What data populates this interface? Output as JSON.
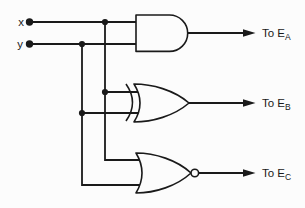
{
  "colors": {
    "ink": "#1a1a1a",
    "paper": "#fcfcfc"
  },
  "inputs": [
    {
      "label": "x"
    },
    {
      "label": "y"
    }
  ],
  "gates": [
    {
      "type": "AND",
      "inputs": [
        "x",
        "y"
      ],
      "output": "E_A"
    },
    {
      "type": "XOR",
      "inputs": [
        "x",
        "y"
      ],
      "output": "E_B"
    },
    {
      "type": "NOR",
      "inputs": [
        "x",
        "y"
      ],
      "output": "E_C"
    }
  ],
  "outputs": [
    {
      "prefix": "To E",
      "subscript": "A"
    },
    {
      "prefix": "To E",
      "subscript": "B"
    },
    {
      "prefix": "To E",
      "subscript": "C"
    }
  ]
}
